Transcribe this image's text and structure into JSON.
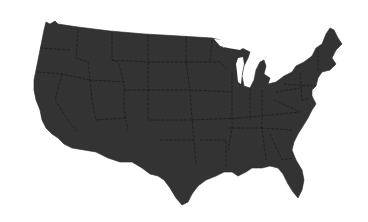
{
  "map": {
    "title": "United States (contiguous)",
    "fill_color": "#333333",
    "border_color": "#1a1a1a",
    "background_color": "#ffffff",
    "style": "silhouette with state borders"
  }
}
